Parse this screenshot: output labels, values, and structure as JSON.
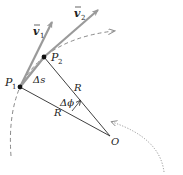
{
  "diagram": {
    "type": "uniform circular motion velocity change",
    "labels": {
      "v1": "v",
      "v1_sub": "1",
      "v2": "v",
      "v2_sub": "2",
      "p1": "P",
      "p1_sub": "1",
      "p2": "P",
      "p2_sub": "2",
      "delta_s": "Δs",
      "r_upper": "R",
      "r_lower": "R",
      "delta_phi": "Δϕ",
      "center": "O"
    },
    "colors": {
      "vector": "#9a9a9a",
      "line": "#2a2a2a",
      "dashed_path": "#8a8a8a",
      "dotted_arc": "#8a8a8a"
    }
  }
}
